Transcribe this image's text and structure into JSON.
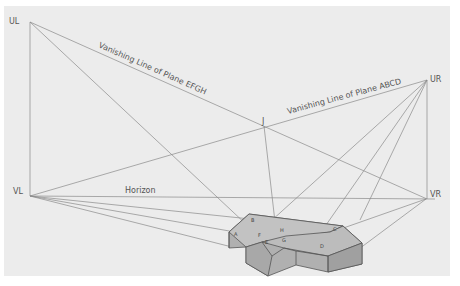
{
  "diagram": {
    "points": {
      "UL": {
        "label": "UL",
        "x": 30,
        "y": 22
      },
      "UR": {
        "label": "UR",
        "x": 427,
        "y": 80
      },
      "VL": {
        "label": "VL",
        "x": 30,
        "y": 196
      },
      "VR": {
        "label": "VR",
        "x": 426,
        "y": 199
      },
      "J": {
        "label": "J",
        "x": 264,
        "y": 126
      }
    },
    "lines": {
      "horizon": "Horizon",
      "efgh": "Vanishing Line of Plane EFGH",
      "abcd": "Vanishing Line of Plane ABCD"
    },
    "corners": [
      "A",
      "B",
      "C",
      "D",
      "E",
      "F",
      "G",
      "H"
    ],
    "colors": {
      "background": "#ececec",
      "line": "#8a8a8a",
      "solid_fill": "#b5b5b5",
      "edge": "#555555"
    }
  }
}
